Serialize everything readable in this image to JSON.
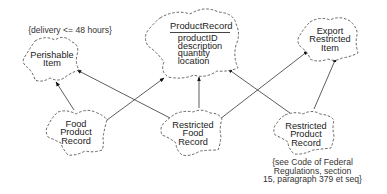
{
  "diagram": {
    "type": "class-diagram-cloud-notation",
    "nodes": {
      "perishable_item": {
        "lines": [
          "Perishable",
          "Item"
        ]
      },
      "product_record": {
        "title": "ProductRecord",
        "attributes": [
          "productID",
          "description",
          "quantity",
          "location"
        ]
      },
      "export_restricted_item": {
        "lines": [
          "Export",
          "Restricted",
          "Item"
        ]
      },
      "food_product_record": {
        "lines": [
          "Food",
          "Product",
          "Record"
        ]
      },
      "restricted_food_record": {
        "lines": [
          "Restricted",
          "Food",
          "Record"
        ]
      },
      "restricted_product_record": {
        "lines": [
          "Restricted",
          "Product",
          "Record"
        ]
      }
    },
    "notes": {
      "perishable_constraint": "{delivery <= 48 hours}",
      "restricted_product_constraint": [
        "{see Code of Federal",
        "Regulations, section",
        "15, paragraph 379 et seq}"
      ]
    },
    "edges": [
      {
        "from": "Food Product Record",
        "to": "Perishable Item"
      },
      {
        "from": "Food Product Record",
        "to": "ProductRecord"
      },
      {
        "from": "Restricted Food Record",
        "to": "Perishable Item"
      },
      {
        "from": "Restricted Food Record",
        "to": "ProductRecord"
      },
      {
        "from": "Restricted Food Record",
        "to": "Export Restricted Item"
      },
      {
        "from": "Restricted Product Record",
        "to": "ProductRecord"
      },
      {
        "from": "Restricted Product Record",
        "to": "Export Restricted Item"
      }
    ],
    "colors": {
      "outline": "#555555",
      "edge": "#333333",
      "text": "#222222"
    }
  }
}
